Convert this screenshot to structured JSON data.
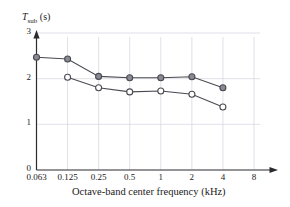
{
  "chart_data": {
    "type": "line",
    "title": "",
    "xlabel": "Octave-band center frequency (kHz)",
    "ylabel": "T",
    "ylabel_sub": "sub",
    "ylabel_units": "(s)",
    "ylabel_full": "T_sub (s)",
    "x_tick_labels": [
      "0.063",
      "0.125",
      "0.25",
      "0.5",
      "1",
      "2",
      "4",
      "8"
    ],
    "x_tick_values": [
      0.063,
      0.125,
      0.25,
      0.5,
      1,
      2,
      4,
      8
    ],
    "x_scale": "log2-octave",
    "y_tick_labels": [
      "0",
      "1",
      "2",
      "3"
    ],
    "y_tick_values": [
      0,
      1,
      2,
      3
    ],
    "ylim": [
      0,
      3
    ],
    "grid": true,
    "grid_color": "#d8d8e2",
    "legend": "none",
    "series": [
      {
        "name": "series-filled",
        "marker": "filled-circle",
        "color": "#4a4a52",
        "marker_fill": "#8a8a95",
        "categories": [
          "0.063",
          "0.125",
          "0.25",
          "0.5",
          "1",
          "2",
          "4"
        ],
        "x": [
          0.063,
          0.125,
          0.25,
          0.5,
          1,
          2,
          4
        ],
        "values": [
          2.47,
          2.43,
          2.05,
          2.02,
          2.02,
          2.04,
          1.8
        ]
      },
      {
        "name": "series-open",
        "marker": "open-circle",
        "color": "#4a4a52",
        "marker_fill": "#ffffff",
        "categories": [
          "0.125",
          "0.25",
          "0.5",
          "1",
          "2",
          "4"
        ],
        "x": [
          0.125,
          0.25,
          0.5,
          1,
          2,
          4
        ],
        "values": [
          2.03,
          1.8,
          1.71,
          1.73,
          1.66,
          1.38
        ]
      }
    ]
  }
}
